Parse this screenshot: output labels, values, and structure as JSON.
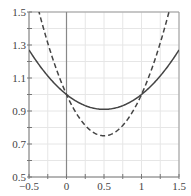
{
  "chart_data": {
    "type": "line",
    "title": "",
    "xlabel": "",
    "ylabel": "",
    "xlim": [
      -0.5,
      1.5
    ],
    "ylim": [
      0.5,
      1.5
    ],
    "grid": true,
    "x_ticks": [
      "-0.5",
      "0",
      "0.5",
      "1",
      "1.5"
    ],
    "y_ticks": [
      "0.5",
      "0.7",
      "0.9",
      "1.1",
      "1.3",
      "1.5"
    ],
    "vertical_line_at_x": 0,
    "series": [
      {
        "name": "solid curve",
        "style": "solid",
        "color": "#444444",
        "x": [
          -0.5,
          -0.25,
          0,
          0.25,
          0.5,
          0.75,
          1,
          1.25,
          1.5
        ],
        "y": [
          1.21,
          1.1,
          1.0,
          0.94,
          0.91,
          0.94,
          1.0,
          1.1,
          1.21
        ]
      },
      {
        "name": "dashed curve",
        "style": "dashed",
        "color": "#444444",
        "x": [
          -0.37,
          -0.25,
          0,
          0.25,
          0.5,
          0.75,
          1,
          1.25,
          1.37
        ],
        "y": [
          1.5,
          1.31,
          1.0,
          0.81,
          0.75,
          0.81,
          1.0,
          1.31,
          1.5
        ]
      }
    ]
  }
}
